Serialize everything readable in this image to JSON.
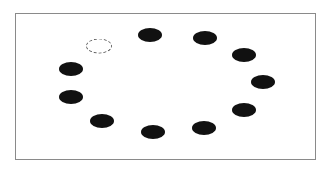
{
  "diagram": {
    "type": "ring-of-ellipses",
    "frame": {
      "x": 15,
      "y": 13,
      "width": 301,
      "height": 147,
      "border_color": "#8a8a8a"
    },
    "fill_color": "#111111",
    "empty_outline_color": "#666666",
    "items": [
      {
        "id": "slot-1",
        "x": 99,
        "y": 46,
        "state": "empty"
      },
      {
        "id": "slot-2",
        "x": 150,
        "y": 35,
        "state": "filled"
      },
      {
        "id": "slot-3",
        "x": 205,
        "y": 38,
        "state": "filled"
      },
      {
        "id": "slot-4",
        "x": 244,
        "y": 55,
        "state": "filled"
      },
      {
        "id": "slot-5",
        "x": 263,
        "y": 82,
        "state": "filled"
      },
      {
        "id": "slot-6",
        "x": 244,
        "y": 110,
        "state": "filled"
      },
      {
        "id": "slot-7",
        "x": 204,
        "y": 128,
        "state": "filled"
      },
      {
        "id": "slot-8",
        "x": 153,
        "y": 132,
        "state": "filled"
      },
      {
        "id": "slot-9",
        "x": 102,
        "y": 121,
        "state": "filled"
      },
      {
        "id": "slot-10",
        "x": 71,
        "y": 97,
        "state": "filled"
      },
      {
        "id": "slot-11",
        "x": 71,
        "y": 69,
        "state": "filled"
      }
    ],
    "filled_count": 10,
    "empty_count": 1
  }
}
